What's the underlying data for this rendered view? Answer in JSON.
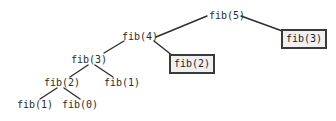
{
  "diagram": {
    "background_color": "#ffffff",
    "edge_color": "#2d2d2d",
    "text_color": "#2b2b2b",
    "box_border_color": "#3a3a3a",
    "box_fill_color": "#f0f0f0",
    "nodes": [
      {
        "id": "n0",
        "label": "fib(5)",
        "boxed": false,
        "x": 209,
        "y": 10,
        "level": 0
      },
      {
        "id": "n1",
        "label": "fib(4)",
        "boxed": false,
        "x": 122,
        "y": 31,
        "level": 1
      },
      {
        "id": "n2",
        "label": "fib(3)",
        "boxed": true,
        "x": 281,
        "y": 29,
        "level": 1
      },
      {
        "id": "n3",
        "label": "fib(3)",
        "boxed": false,
        "x": 71,
        "y": 54,
        "level": 2
      },
      {
        "id": "n4",
        "label": "fib(2)",
        "boxed": true,
        "x": 169,
        "y": 54,
        "level": 2
      },
      {
        "id": "n5",
        "label": "fib(2)",
        "boxed": false,
        "x": 44,
        "y": 77,
        "level": 3
      },
      {
        "id": "n6",
        "label": "fib(1)",
        "boxed": false,
        "x": 104,
        "y": 77,
        "level": 3
      },
      {
        "id": "n7",
        "label": "fib(1)",
        "boxed": false,
        "x": 17,
        "y": 99,
        "level": 4
      },
      {
        "id": "n8",
        "label": "fib(0)",
        "boxed": false,
        "x": 62,
        "y": 99,
        "level": 4
      }
    ],
    "edges": [
      {
        "from": "n0",
        "to": "n1",
        "x1": 207,
        "y1": 16,
        "x2": 156,
        "y2": 37
      },
      {
        "from": "n0",
        "to": "n2",
        "x1": 241,
        "y1": 16,
        "x2": 285,
        "y2": 32
      },
      {
        "from": "n1",
        "to": "n3",
        "x1": 124,
        "y1": 41,
        "x2": 104,
        "y2": 53
      },
      {
        "from": "n1",
        "to": "n4",
        "x1": 154,
        "y1": 41,
        "x2": 173,
        "y2": 56
      },
      {
        "from": "n3",
        "to": "n5",
        "x1": 88,
        "y1": 65,
        "x2": 70,
        "y2": 77
      },
      {
        "from": "n3",
        "to": "n6",
        "x1": 95,
        "y1": 65,
        "x2": 113,
        "y2": 77
      },
      {
        "from": "n5",
        "to": "n7",
        "x1": 57,
        "y1": 88,
        "x2": 40,
        "y2": 99
      },
      {
        "from": "n5",
        "to": "n8",
        "x1": 64,
        "y1": 88,
        "x2": 80,
        "y2": 99
      }
    ]
  }
}
